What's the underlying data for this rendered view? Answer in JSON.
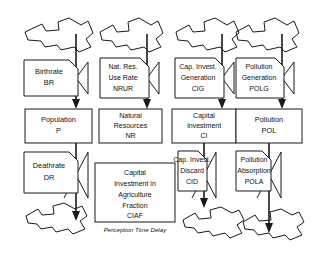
{
  "diagram": {
    "type": "system-dynamics-stock-and-flow",
    "background_color": "#ffffff",
    "line_color": "#1a1a1a",
    "stocks": [
      {
        "id": "population",
        "name_line1": "Population",
        "name_line2": "P",
        "name_line3": "",
        "name_line4": ""
      },
      {
        "id": "natres",
        "name_line1": "Natural",
        "name_line2": "Resources",
        "name_line3": "NR",
        "name_line4": ""
      },
      {
        "id": "capinvest",
        "name_line1": "Capital",
        "name_line2": "Investment",
        "name_line3": "CI",
        "name_line4": ""
      },
      {
        "id": "pollution",
        "name_line1": "Pollution",
        "name_line2": "POL",
        "name_line3": "",
        "name_line4": ""
      }
    ],
    "inflow_rates": [
      {
        "id": "birthrate",
        "name_line1": "Birthrate",
        "name_line2": "BR",
        "name_line3": ""
      },
      {
        "id": "nrur",
        "name_line1": "Nat. Res.",
        "name_line2": "Use Rate",
        "name_line3": "NRUR"
      },
      {
        "id": "cig",
        "name_line1": "Cap. Invest.",
        "name_line2": "Generation",
        "name_line3": "CIG"
      },
      {
        "id": "polg",
        "name_line1": "Pollution",
        "name_line2": "Generation",
        "name_line3": "POLG"
      }
    ],
    "outflow_rates": [
      {
        "id": "deathrate",
        "name_line1": "Deathrate",
        "name_line2": "DR",
        "name_line3": ""
      },
      {
        "id": "cid",
        "name_line1": "Cap. Invest.",
        "name_line2": "Discard",
        "name_line3": "CID"
      },
      {
        "id": "pola",
        "name_line1": "Pollution",
        "name_line2": "Absorption",
        "name_line3": "POLA"
      }
    ],
    "auxiliaries": [
      {
        "id": "ciaf",
        "name_line1": "Capital",
        "name_line2": "Investment in",
        "name_line3": "Agriculture",
        "name_line4": "Fraction",
        "name_line5": "CIAF"
      }
    ],
    "annotations": [
      {
        "id": "perception-time-delay",
        "text": "Perception Time Delay"
      }
    ],
    "sources_sinks_count": 7
  }
}
